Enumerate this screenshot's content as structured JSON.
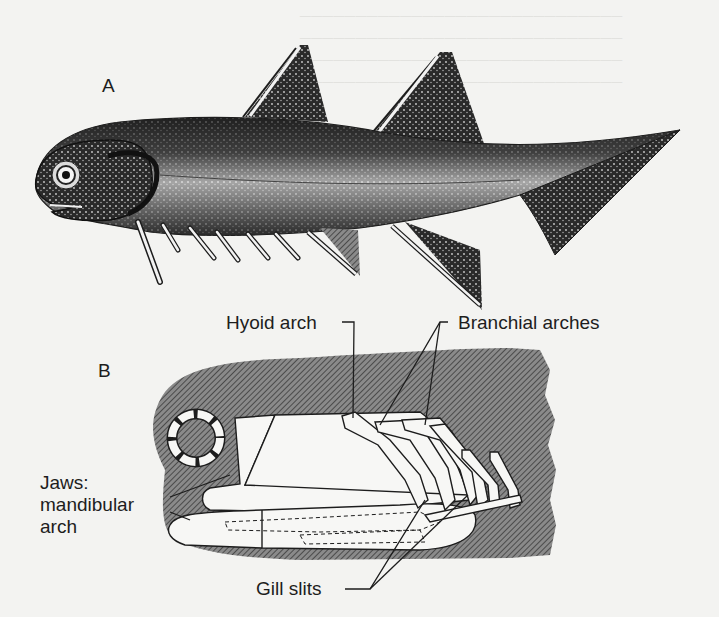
{
  "figure": {
    "panel_a": {
      "letter": "A",
      "subject": "acanthodian-fish-illustration"
    },
    "panel_b": {
      "letter": "B",
      "subject": "head-skeleton-diagram",
      "labels": {
        "hyoid_arch": "Hyoid arch",
        "branchial_arches": "Branchial arches",
        "jaws_line1": "Jaws:",
        "jaws_line2": "mandibular",
        "jaws_line3": "arch",
        "gill_slits": "Gill slits"
      }
    },
    "colors": {
      "background": "#f3f3f1",
      "ink": "#1d1d1d",
      "hatch_fill": "#6b6b6b",
      "bone": "#f7f7f5"
    }
  }
}
